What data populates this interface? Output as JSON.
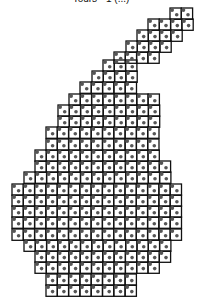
{
  "figure": {
    "title": "Tours - 1 (...)",
    "cell_size": 11.3,
    "line_color": "#111111",
    "node_color": "#555555",
    "rows": [
      {
        "y": 8,
        "x0": 170,
        "x1": 193
      },
      {
        "y": 19,
        "x0": 148,
        "x1": 193
      },
      {
        "y": 30,
        "x0": 137,
        "x1": 182
      },
      {
        "y": 41,
        "x0": 126,
        "x1": 170
      },
      {
        "y": 52,
        "x0": 114,
        "x1": 159
      },
      {
        "y": 60,
        "x0": 103,
        "x1": 140
      },
      {
        "y": 71,
        "x0": 92,
        "x1": 140
      },
      {
        "y": 82,
        "x0": 80,
        "x1": 140
      },
      {
        "y": 94,
        "x0": 69,
        "x1": 163
      },
      {
        "y": 105,
        "x0": 58,
        "x1": 163
      },
      {
        "y": 116,
        "x0": 58,
        "x1": 163
      },
      {
        "y": 127,
        "x0": 46,
        "x1": 163
      },
      {
        "y": 139,
        "x0": 46,
        "x1": 163
      },
      {
        "y": 150,
        "x0": 35,
        "x1": 163
      },
      {
        "y": 161,
        "x0": 35,
        "x1": 175
      },
      {
        "y": 172,
        "x0": 24,
        "x1": 175
      },
      {
        "y": 184,
        "x0": 12,
        "x1": 186
      },
      {
        "y": 195,
        "x0": 12,
        "x1": 186
      },
      {
        "y": 206,
        "x0": 12,
        "x1": 186
      },
      {
        "y": 217,
        "x0": 12,
        "x1": 186
      },
      {
        "y": 229,
        "x0": 12,
        "x1": 186
      },
      {
        "y": 240,
        "x0": 24,
        "x1": 175
      },
      {
        "y": 251,
        "x0": 35,
        "x1": 175
      },
      {
        "y": 262,
        "x0": 35,
        "x1": 163
      },
      {
        "y": 274,
        "x0": 46,
        "x1": 140
      },
      {
        "y": 285,
        "x0": 46,
        "x1": 140
      }
    ]
  }
}
